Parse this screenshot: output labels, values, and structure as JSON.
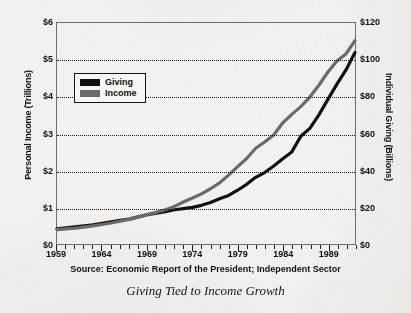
{
  "chart_data": {
    "type": "line",
    "title": "",
    "caption": "Giving Tied to Income Growth",
    "source": "Source: Economic Report of the President; Independent Sector",
    "xlabel": "",
    "ylabel": "Personal Income (Trillions)",
    "y2label": "Individual Giving (Billions)",
    "xlim": [
      1959,
      1992
    ],
    "ylim": [
      0,
      6
    ],
    "y2lim": [
      0,
      120
    ],
    "grid": true,
    "legend_position": "upper-left-inside",
    "x_tick_labels": [
      "1959",
      "1964",
      "1969",
      "1974",
      "1979",
      "1984",
      "1989"
    ],
    "x_tick_values": [
      1959,
      1964,
      1969,
      1974,
      1979,
      1984,
      1989
    ],
    "y_left_tick_labels": [
      "$0",
      "$1",
      "$2",
      "$3",
      "$4",
      "$5",
      "$6"
    ],
    "y_left_tick_values": [
      0,
      1,
      2,
      3,
      4,
      5,
      6
    ],
    "y_right_tick_labels": [
      "$0",
      "$20",
      "$40",
      "$60",
      "$80",
      "$100",
      "$120"
    ],
    "y_right_tick_values": [
      0,
      20,
      40,
      60,
      80,
      100,
      120
    ],
    "x": [
      1959,
      1960,
      1961,
      1962,
      1963,
      1964,
      1965,
      1966,
      1967,
      1968,
      1969,
      1970,
      1971,
      1972,
      1973,
      1974,
      1975,
      1976,
      1977,
      1978,
      1979,
      1980,
      1981,
      1982,
      1983,
      1984,
      1985,
      1986,
      1987,
      1988,
      1989,
      1990,
      1991,
      1992
    ],
    "series": [
      {
        "name": "Giving",
        "axis": "right",
        "unit": "Billions",
        "color": "#111111",
        "values": [
          8.2,
          8.8,
          9.3,
          9.8,
          10.4,
          11.2,
          12.0,
          12.8,
          13.5,
          14.7,
          15.9,
          16.7,
          17.6,
          18.6,
          19.2,
          19.9,
          21.0,
          22.5,
          24.6,
          26.4,
          29.2,
          32.4,
          36.2,
          38.8,
          42.4,
          46.3,
          50.0,
          58.5,
          62.8,
          70.1,
          78.5,
          86.8,
          94.5,
          104.0
        ]
      },
      {
        "name": "Income",
        "axis": "left",
        "unit": "Trillions",
        "color": "#6a6a6a",
        "values": [
          0.39,
          0.41,
          0.43,
          0.46,
          0.49,
          0.53,
          0.57,
          0.62,
          0.67,
          0.73,
          0.8,
          0.86,
          0.93,
          1.02,
          1.14,
          1.25,
          1.36,
          1.5,
          1.66,
          1.87,
          2.1,
          2.32,
          2.6,
          2.77,
          2.96,
          3.29,
          3.52,
          3.73,
          3.99,
          4.31,
          4.67,
          4.97,
          5.16,
          5.52
        ]
      }
    ],
    "legend": [
      {
        "label": "Giving",
        "color": "#111111"
      },
      {
        "label": "Income",
        "color": "#6a6a6a"
      }
    ]
  }
}
